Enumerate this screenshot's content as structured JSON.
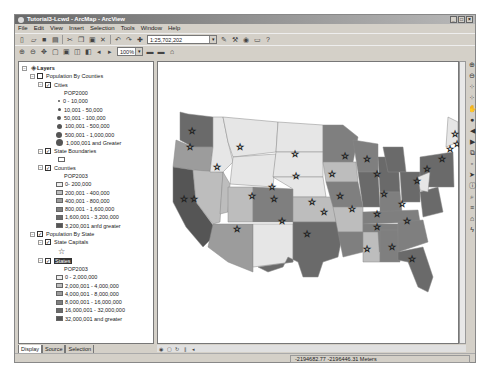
{
  "window": {
    "title": "Tutorial3-Lcwd - ArcMap - ArcView",
    "controls": [
      "_",
      "□",
      "×"
    ]
  },
  "menu": [
    "File",
    "Edit",
    "View",
    "Insert",
    "Selection",
    "Tools",
    "Window",
    "Help"
  ],
  "toolbar": {
    "scale": "1:25,702,202",
    "zoom_box": "100%"
  },
  "toc": {
    "root": "Layers",
    "groups": [
      {
        "name": "Population By Counties",
        "layers": [
          {
            "name": "Cities",
            "field": "POP2000",
            "classes": [
              "0 - 10,000",
              "10,001 - 50,000",
              "50,001 - 100,000",
              "100,001 - 500,000",
              "500,001 - 1,000,000",
              "1,000,001 and Greater"
            ]
          },
          {
            "name": "State Boundaries"
          },
          {
            "name": "Counties",
            "field": "POP2003",
            "classes": [
              "0- 200,000",
              "200,001 - 400,000",
              "400,001 - 800,000",
              "800,001 - 1,600,000",
              "1,600,001 - 3,200,000",
              "3,200,001 anfd greater"
            ]
          }
        ]
      },
      {
        "name": "Population By State",
        "layers": [
          {
            "name": "State Capitals"
          },
          {
            "name": "States",
            "field": "POP2003",
            "classes": [
              "0 - 2,000,000",
              "2,000,001 - 4,000,000",
              "4,000,001 - 8,000,000",
              "8,000,001 - 16,000,000",
              "16,000,001 - 32,000,000",
              "32,000,001 and greater"
            ]
          }
        ]
      }
    ],
    "tabs": [
      "Display",
      "Source",
      "Selection"
    ]
  },
  "colors": {
    "class1": "#e6e6e6",
    "class2": "#bdbdbd",
    "class3": "#9c9c9c",
    "class4": "#7f7f7f",
    "class5": "#6a6a6a",
    "class6": "#555555"
  },
  "status": {
    "coords": "-2194682.77  -2196446.31 Meters"
  }
}
